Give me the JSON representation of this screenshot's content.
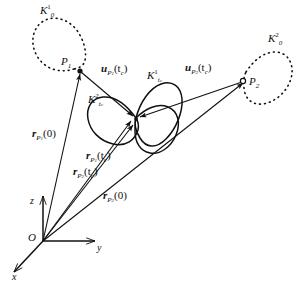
{
  "figure": {
    "background_color": "#ffffff",
    "stroke_color": "#111111",
    "width": 300,
    "height": 288
  },
  "axes": {
    "origin_label": "O",
    "z_label": "z",
    "y_label": "y",
    "x_label": "x"
  },
  "points": [
    {
      "name": "point-p1",
      "label_main": "P",
      "label_sub": "1"
    },
    {
      "name": "point-p2",
      "label_main": "P",
      "label_sub": "2"
    }
  ],
  "curves": [
    {
      "name": "body-outline-k0-1",
      "style": "dotted",
      "label_main": "K",
      "label_sub": "0",
      "label_sup": "1"
    },
    {
      "name": "body-outline-k0-2",
      "style": "dotted",
      "label_main": "K",
      "label_sub": "0",
      "label_sup": "2"
    },
    {
      "name": "body-outline-ktc-1",
      "style": "solid",
      "label_main": "K",
      "label_sub": "t",
      "label_sub2": "c",
      "label_sup": "1"
    },
    {
      "name": "body-outline-ktc-2",
      "style": "solid",
      "label_main": "K",
      "label_sub": "t",
      "label_sub2": "c",
      "label_sup": "2"
    }
  ],
  "vectors": [
    {
      "name": "vector-r-p1-0",
      "label_main": "r",
      "label_sub": "P",
      "label_sub2": "1",
      "label_arg": "(0)"
    },
    {
      "name": "vector-r-p1-tc",
      "label_main": "r",
      "label_sub": "P",
      "label_sub2": "1",
      "label_arg": "(t",
      "label_arg_sub": "c",
      "label_arg_end": ")"
    },
    {
      "name": "vector-r-p2-tc",
      "label_main": "r",
      "label_sub": "P",
      "label_sub2": "2",
      "label_arg": "(t",
      "label_arg_sub": "c",
      "label_arg_end": ")"
    },
    {
      "name": "vector-r-p2-0",
      "label_main": "r",
      "label_sub": "P",
      "label_sub2": "2",
      "label_arg": "(0)"
    },
    {
      "name": "vector-u-p1-tc",
      "label_main": "u",
      "label_sub": "P",
      "label_sub2": "1",
      "label_arg": "(t",
      "label_arg_sub": "c",
      "label_arg_end": ")"
    },
    {
      "name": "vector-u-p2-tc",
      "label_main": "u",
      "label_sub": "P",
      "label_sub2": "2",
      "label_arg": "(t",
      "label_arg_sub": "c",
      "label_arg_end": ")"
    }
  ]
}
